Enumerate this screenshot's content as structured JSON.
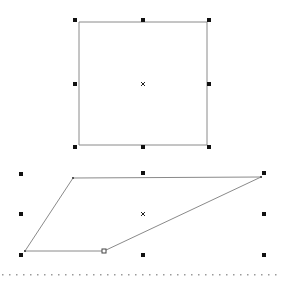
{
  "canvas": {
    "width": 283,
    "height": 282,
    "background": "#ffffff"
  },
  "colors": {
    "stroke": "#8a8a8a",
    "handle": "#111111",
    "dots": "#9a9a9a"
  },
  "shapes": [
    {
      "name": "rectangle",
      "points": [
        [
          79,
          22
        ],
        [
          207,
          22
        ],
        [
          207,
          145
        ],
        [
          79,
          145
        ]
      ],
      "handles": [
        [
          75,
          20
        ],
        [
          143,
          20
        ],
        [
          209,
          20
        ],
        [
          75,
          84
        ],
        [
          209,
          84
        ],
        [
          75,
          147
        ],
        [
          143,
          147
        ],
        [
          209,
          147
        ]
      ],
      "center": [
        143,
        84
      ]
    },
    {
      "name": "trapezoid",
      "points": [
        [
          73,
          178
        ],
        [
          261,
          177
        ],
        [
          104,
          251
        ],
        [
          25,
          251
        ]
      ],
      "vertex_markers": [
        [
          73,
          178
        ],
        [
          261,
          177
        ],
        [
          25,
          251
        ]
      ],
      "hollow_vertex": [
        104,
        251
      ],
      "handles": [
        [
          21,
          174
        ],
        [
          143,
          173
        ],
        [
          264,
          173
        ],
        [
          21,
          214
        ],
        [
          264,
          214
        ],
        [
          21,
          255
        ],
        [
          143,
          255
        ],
        [
          264,
          255
        ]
      ],
      "center": [
        143,
        214
      ]
    }
  ],
  "dotted_line": {
    "y": 274,
    "x_start": 2,
    "x_end": 281,
    "spacing": 7
  }
}
